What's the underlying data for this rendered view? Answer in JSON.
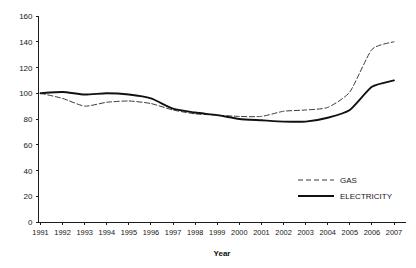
{
  "chart_data": {
    "type": "line",
    "title": "",
    "xlabel": "Year",
    "ylabel": "",
    "grid": false,
    "legend_position": "inside-right",
    "x": [
      1991,
      1992,
      1993,
      1994,
      1995,
      1996,
      1997,
      1998,
      1999,
      2000,
      2001,
      2002,
      2003,
      2004,
      2005,
      2006,
      2007
    ],
    "categories": [
      "1991",
      "1992",
      "1993",
      "1994",
      "1995",
      "1996",
      "1997",
      "1998",
      "1999",
      "2000",
      "2001",
      "2002",
      "2003",
      "2004",
      "2005",
      "2006",
      "2007"
    ],
    "xlim": [
      1991,
      2007
    ],
    "ylim": [
      0,
      160
    ],
    "yticks": [
      0,
      20,
      40,
      60,
      80,
      100,
      120,
      140,
      160
    ],
    "series": [
      {
        "name": "GAS",
        "style": "dashed",
        "color": "#3a3a3a",
        "values": [
          100,
          96,
          90,
          93,
          94,
          92,
          87,
          84,
          83,
          82,
          82,
          86,
          87,
          89,
          101,
          134,
          140
        ]
      },
      {
        "name": "ELECTRICITY",
        "style": "solid",
        "color": "#111111",
        "values": [
          100,
          101,
          99,
          100,
          99,
          96,
          88,
          85,
          83,
          80,
          79,
          78,
          78,
          81,
          87,
          105,
          110
        ]
      }
    ]
  },
  "axes": {
    "x_title": "Year",
    "y_tick_labels": [
      "160",
      "140",
      "120",
      "100",
      "80",
      "60",
      "40",
      "20",
      "0"
    ],
    "x_tick_labels": [
      "1991",
      "1992",
      "1993",
      "1994",
      "1995",
      "1996",
      "1997",
      "1998",
      "1999",
      "2000",
      "2001",
      "2002",
      "2003",
      "2004",
      "2005",
      "2006",
      "2007"
    ]
  },
  "legend": {
    "items": [
      {
        "label": "GAS",
        "style": "dashed"
      },
      {
        "label": "ELECTRICITY",
        "style": "solid"
      }
    ]
  }
}
